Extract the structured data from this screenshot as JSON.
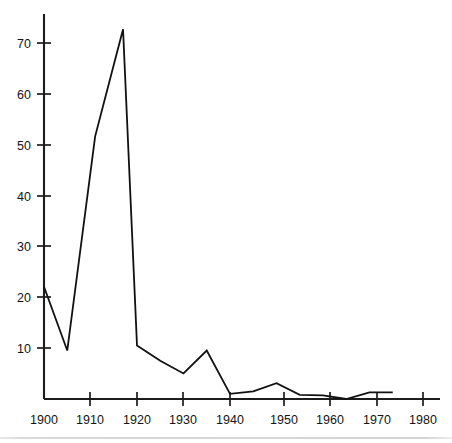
{
  "chart_data": {
    "type": "line",
    "title": "",
    "subtitle": "",
    "xlabel": "",
    "ylabel": "",
    "xlim": [
      1900,
      1983
    ],
    "ylim": [
      0,
      78
    ],
    "grid": false,
    "legend": false,
    "legend_position": "none",
    "x_ticks": [
      1900,
      1910,
      1920,
      1930,
      1940,
      1950,
      1960,
      1970,
      1980
    ],
    "x_tick_labels": [
      "1900",
      "1910",
      "1920",
      "1930",
      "1940",
      "1950",
      "1960",
      "1970",
      "1980"
    ],
    "y_ticks": [
      10,
      20,
      30,
      40,
      50,
      60,
      70
    ],
    "y_tick_labels": [
      "10",
      "20",
      "30",
      "40",
      "50",
      "60",
      "70"
    ],
    "series": [
      {
        "name": "series-1",
        "color": "#111111",
        "x": [
          1900,
          1905,
          1911,
          1917,
          1920,
          1925,
          1930,
          1935,
          1940,
          1945,
          1950,
          1955,
          1960,
          1965,
          1970,
          1975
        ],
        "values": [
          22,
          9.5,
          51.5,
          72.5,
          10.5,
          7.5,
          5,
          9.5,
          1,
          1.5,
          3.1,
          0.8,
          0.7,
          0,
          1.3,
          1.3
        ]
      }
    ],
    "axis_color": "#1c1c1c",
    "background": "#ffffff"
  },
  "figure": {
    "plot_origin_x": 44,
    "plot_origin_y": 399,
    "x_pixels_per_decade": 46.5,
    "y_pixels_per_unit": 5.1,
    "axis_top_y": 14,
    "axis_right_x": 440
  }
}
